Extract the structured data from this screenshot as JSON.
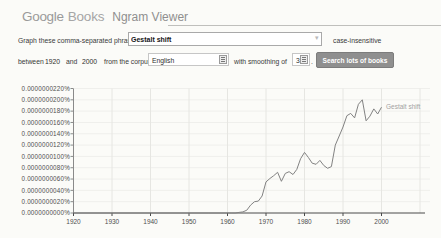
{
  "header": {
    "google": "Google",
    "books": "Books",
    "title": "Ngram Viewer"
  },
  "form": {
    "phrases_label": "Graph these comma-separated phrases:",
    "phrases_value": "Gestalt shift",
    "case_label": "case-insensitive",
    "between_label": "between",
    "year_start": "1920",
    "and_label": "and",
    "year_end": "2000",
    "corpus_label": "from the corpus",
    "corpus_value": "English",
    "smoothing_label": "with smoothing of",
    "smoothing_value": "3",
    "period_label": ".",
    "search_button": "Search lots of books"
  },
  "colors": {
    "line": "#828282",
    "series_label": "#a2a2a2",
    "button_bg": "#8f8f8f",
    "grid_vertical": "#e6e6e2",
    "grid_horizontal": "#efefec",
    "axis": "#4a4a4a",
    "y_axis_line": "#8a8a8a",
    "tick_text": "#4f4f4f"
  },
  "chart_data": {
    "type": "line",
    "title": "",
    "xlabel": "",
    "ylabel": "",
    "grid": true,
    "legend_position": "end-of-line-label",
    "xlim": [
      1920,
      2010
    ],
    "x_ticks": [
      "1920",
      "1930",
      "1940",
      "1950",
      "1960",
      "1970",
      "1980",
      "1990",
      "2000"
    ],
    "y_unit": "percent x 1e-10",
    "ylim": [
      0,
      220
    ],
    "y_tick_values": [
      220,
      200,
      180,
      160,
      140,
      120,
      100,
      80,
      60,
      40,
      20,
      0
    ],
    "y_ticks_labels": [
      "0.0000000220%",
      "0.0000000200%",
      "0.0000000180%",
      "0.0000000160%",
      "0.0000000140%",
      "0.0000000120%",
      "0.0000000100%",
      "0.0000000080%",
      "0.0000000060%",
      "0.0000000040%",
      "0.0000000020%",
      "0.0000000000%"
    ],
    "series": [
      {
        "name": "Gestalt shift",
        "color": "#828282",
        "label_color": "#a2a2a2",
        "points": [
          [
            1920,
            0
          ],
          [
            1930,
            0
          ],
          [
            1940,
            0
          ],
          [
            1950,
            0
          ],
          [
            1955,
            0
          ],
          [
            1958,
            0
          ],
          [
            1960,
            0
          ],
          [
            1961,
            0
          ],
          [
            1962,
            0
          ],
          [
            1963,
            1
          ],
          [
            1964,
            2
          ],
          [
            1965,
            5
          ],
          [
            1966,
            14
          ],
          [
            1967,
            20
          ],
          [
            1968,
            21
          ],
          [
            1969,
            30
          ],
          [
            1970,
            55
          ],
          [
            1971,
            61
          ],
          [
            1972,
            66
          ],
          [
            1973,
            72
          ],
          [
            1974,
            56
          ],
          [
            1975,
            70
          ],
          [
            1976,
            73
          ],
          [
            1977,
            68
          ],
          [
            1978,
            77
          ],
          [
            1979,
            96
          ],
          [
            1980,
            107
          ],
          [
            1981,
            98
          ],
          [
            1982,
            88
          ],
          [
            1983,
            86
          ],
          [
            1984,
            93
          ],
          [
            1985,
            84
          ],
          [
            1986,
            79
          ],
          [
            1987,
            82
          ],
          [
            1988,
            120
          ],
          [
            1989,
            136
          ],
          [
            1990,
            152
          ],
          [
            1991,
            172
          ],
          [
            1992,
            176
          ],
          [
            1993,
            168
          ],
          [
            1994,
            192
          ],
          [
            1995,
            200
          ],
          [
            1996,
            163
          ],
          [
            1997,
            171
          ],
          [
            1998,
            184
          ],
          [
            1999,
            175
          ],
          [
            2000,
            187
          ]
        ]
      }
    ]
  }
}
